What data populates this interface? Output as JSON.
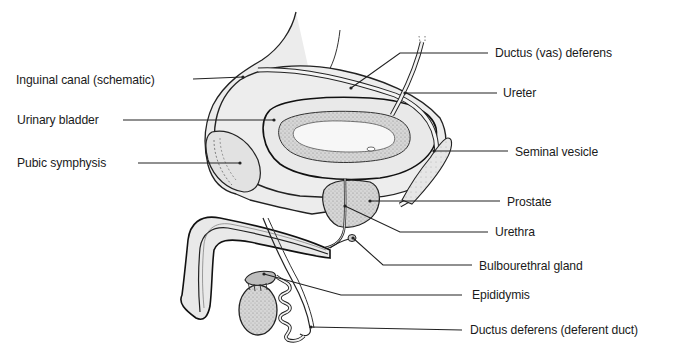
{
  "diagram": {
    "type": "anatomical-illustration",
    "colors": {
      "background": "#ffffff",
      "ink": "#1a1a1a",
      "tissue_light": "#ececec",
      "tissue_mid": "#d4d4d4",
      "tissue_dark": "#a9a9a9",
      "leader_line": "#222222"
    },
    "labels": [
      {
        "id": "inguinal-canal",
        "text": "Inguinal canal (schematic)",
        "x": 16,
        "y": 72,
        "side": "left"
      },
      {
        "id": "urinary-bladder",
        "text": "Urinary bladder",
        "x": 17,
        "y": 112,
        "side": "left"
      },
      {
        "id": "pubic-symphysis",
        "text": "Pubic symphysis",
        "x": 17,
        "y": 155,
        "side": "left"
      },
      {
        "id": "ductus-vas-deferens",
        "text": "Ductus (vas) deferens",
        "x": 495,
        "y": 45,
        "side": "right"
      },
      {
        "id": "ureter",
        "text": "Ureter",
        "x": 503,
        "y": 85,
        "side": "right"
      },
      {
        "id": "seminal-vesicle",
        "text": "Seminal vesicle",
        "x": 515,
        "y": 144,
        "side": "right"
      },
      {
        "id": "prostate",
        "text": "Prostate",
        "x": 507,
        "y": 194,
        "side": "right"
      },
      {
        "id": "urethra",
        "text": "Urethra",
        "x": 495,
        "y": 224,
        "side": "right"
      },
      {
        "id": "bulbourethral-gland",
        "text": "Bulbourethral gland",
        "x": 479,
        "y": 258,
        "side": "right"
      },
      {
        "id": "epididymis",
        "text": "Epididymis",
        "x": 472,
        "y": 287,
        "side": "right"
      },
      {
        "id": "ductus-deferens-duct",
        "text": "Ductus deferens (deferent duct)",
        "x": 470,
        "y": 322,
        "side": "right"
      }
    ]
  }
}
